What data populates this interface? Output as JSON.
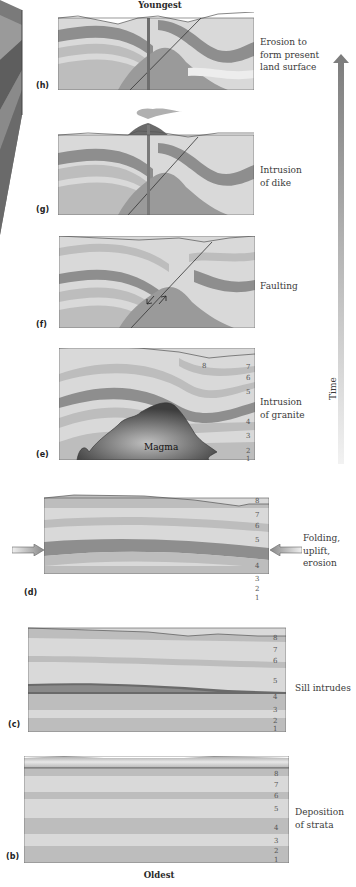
{
  "titles": {
    "top": "Youngest",
    "bottom": "Oldest"
  },
  "time_axis": {
    "label": "Time",
    "direction": "up"
  },
  "panels": [
    {
      "id": "h",
      "label": "(h)",
      "caption": [
        "Erosion to",
        "form present",
        "land surface"
      ]
    },
    {
      "id": "g",
      "label": "(g)",
      "caption": [
        "Intrusion",
        "of dike"
      ]
    },
    {
      "id": "f",
      "label": "(f)",
      "caption": [
        "Faulting"
      ]
    },
    {
      "id": "e",
      "label": "(e)",
      "caption": [
        "Intrusion",
        "of granite"
      ],
      "inner_label": "Magma",
      "strata_numbers": [
        "8",
        "7",
        "6",
        "5",
        "4",
        "3",
        "2",
        "1"
      ]
    },
    {
      "id": "d",
      "label": "(d)",
      "caption": [
        "Folding,",
        "uplift,",
        "erosion"
      ],
      "strata_numbers": [
        "8",
        "7",
        "6",
        "5",
        "4",
        "3",
        "2",
        "1"
      ]
    },
    {
      "id": "c",
      "label": "(c)",
      "caption": [
        "Sill intrudes"
      ],
      "strata_numbers": [
        "8",
        "7",
        "6",
        "5",
        "4",
        "3",
        "2",
        "1"
      ]
    },
    {
      "id": "b",
      "label": "(b)",
      "caption": [
        "Deposition",
        "of strata"
      ],
      "strata_numbers": [
        "8",
        "7",
        "6",
        "5",
        "4",
        "3",
        "2",
        "1"
      ]
    }
  ],
  "colors": {
    "light": "#d9d9d9",
    "mid": "#b8b8b8",
    "dark": "#8e8e8e",
    "granite": "#9a9a9a",
    "outline": "#555555",
    "arrow_top": "#7a7a7a",
    "arrow_bottom": "#f0f0f0"
  }
}
